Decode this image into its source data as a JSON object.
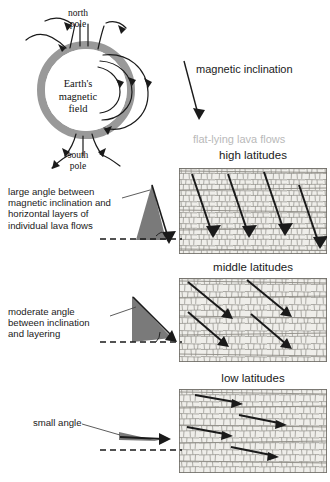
{
  "earth": {
    "core_label": "Earth's\nmagnetic\nfield",
    "core_line1": "Earth's",
    "core_line2": "magnetic",
    "core_line3": "field",
    "north_pole": "north\npole",
    "north_pole_line1": "north",
    "north_pole_line2": "pole",
    "south_pole": "south\npole",
    "south_pole_line1": "south",
    "south_pole_line2": "pole",
    "ring_color": "#999999",
    "field_line_color": "#1a1a1a"
  },
  "labels": {
    "magnetic_inclination": "magnetic inclination",
    "flat_lying_lava_flows": "flat-lying lava flows",
    "flat_lying_color": "#b9b9b9"
  },
  "bands": [
    {
      "id": "high",
      "title": "high latitudes",
      "caption": "large angle between magnetic inclination and horizontal layers of individual lava flows",
      "caption_lines": [
        "large angle between",
        "magnetic inclination and",
        "horizontal layers of",
        "individual lava flows"
      ],
      "inclination_degrees": 70,
      "wedge_fill": "#7a7a7a",
      "arrow_count": 4
    },
    {
      "id": "middle",
      "title": "middle latitudes",
      "caption": "moderate angle between inclination and layering",
      "caption_lines": [
        "moderate angle",
        "between inclination",
        "and layering"
      ],
      "inclination_degrees": 45,
      "wedge_fill": "#7a7a7a",
      "arrow_count": 4
    },
    {
      "id": "low",
      "title": "low latitudes",
      "caption": "small angle",
      "caption_lines": [
        "small angle"
      ],
      "inclination_degrees": 12,
      "wedge_fill": "#7a7a7a",
      "arrow_count": 4
    }
  ],
  "colors": {
    "ink": "#1a1a1a",
    "lava_fill": "#efeeea",
    "lava_line": "#8d8b85",
    "wedge": "#7a7a7a",
    "dashed_baseline": "#1a1a1a"
  }
}
